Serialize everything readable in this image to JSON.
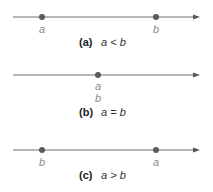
{
  "panels": [
    {
      "tag": "(a)",
      "relation": "a < b",
      "points": [
        {
          "label": "a",
          "position": "left"
        },
        {
          "label": "b",
          "position": "right"
        }
      ]
    },
    {
      "tag": "(b)",
      "relation": "a = b",
      "points": [
        {
          "label": "a",
          "position": "center"
        },
        {
          "label": "b",
          "position": "center"
        }
      ]
    },
    {
      "tag": "(c)",
      "relation": "a > b",
      "points": [
        {
          "label": "b",
          "position": "left"
        },
        {
          "label": "a",
          "position": "right"
        }
      ]
    }
  ],
  "colors": {
    "line": "#6e6e6e",
    "point": "#5a5a5a",
    "label": "#8a8a8a",
    "caption": "#222222"
  }
}
